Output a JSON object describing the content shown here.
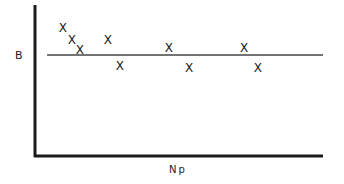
{
  "chart_data": {
    "type": "scatter",
    "title": "",
    "xlabel": "Np",
    "ylabel": "B",
    "xlim": [
      0,
      100
    ],
    "ylim": [
      0,
      100
    ],
    "grid": false,
    "legend": null,
    "ticks": {
      "x": [],
      "y": []
    },
    "marker": "x",
    "series": [
      {
        "name": "data",
        "points": [
          {
            "x": 9.7,
            "y": 84.8
          },
          {
            "x": 12.8,
            "y": 76.8
          },
          {
            "x": 15.6,
            "y": 70.2
          },
          {
            "x": 25.3,
            "y": 76.8
          },
          {
            "x": 29.5,
            "y": 59.6
          },
          {
            "x": 46.5,
            "y": 71.5
          },
          {
            "x": 53.5,
            "y": 58.3
          },
          {
            "x": 72.6,
            "y": 71.5
          },
          {
            "x": 77.4,
            "y": 58.3
          }
        ]
      }
    ],
    "reference_lines": [
      {
        "orientation": "horizontal",
        "y": 66.9,
        "x_start": 4.2,
        "x_end": 100
      }
    ],
    "colors": {
      "ink": "#1a1a1a",
      "background": "#ffffff"
    }
  }
}
